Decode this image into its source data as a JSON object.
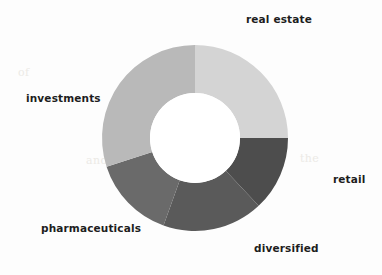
{
  "chart_data": {
    "type": "pie",
    "variant": "donut",
    "title": "",
    "subtitle": "",
    "xlabel": "",
    "ylabel": "",
    "legend_position": "none",
    "labels_position": "outside",
    "grid": false,
    "start_angle_deg": 0,
    "direction": "clockwise",
    "inner_radius_ratio": 0.48,
    "categories": [
      "real estate",
      "retail",
      "diversified",
      "pharmaceuticals",
      "investments"
    ],
    "values": [
      25.0,
      13.0,
      17.5,
      14.5,
      30.0
    ],
    "colors": [
      "#d4d4d4",
      "#4d4d4d",
      "#5a5a5a",
      "#6a6a6a",
      "#b9b9b9"
    ],
    "slices": [
      {
        "label": "real estate",
        "value": 25.0,
        "color": "#d4d4d4",
        "start_deg": 0,
        "end_deg": 90
      },
      {
        "label": "retail",
        "value": 13.0,
        "color": "#4d4d4d",
        "start_deg": 90,
        "end_deg": 136.8
      },
      {
        "label": "diversified",
        "value": 17.5,
        "color": "#5a5a5a",
        "start_deg": 136.8,
        "end_deg": 199.8
      },
      {
        "label": "pharmaceuticals",
        "value": 14.5,
        "color": "#6a6a6a",
        "start_deg": 199.8,
        "end_deg": 252.0
      },
      {
        "label": "investments",
        "value": 30.0,
        "color": "#b9b9b9",
        "start_deg": 252.0,
        "end_deg": 360.0
      }
    ]
  },
  "chart": {
    "center_x": 195,
    "center_y": 138,
    "outer_radius": 93,
    "inner_radius": 45,
    "hole_color": "#ffffff",
    "background": "#fdfdfd"
  },
  "labels": {
    "real_estate": "real estate",
    "retail": "retail",
    "diversified": "diversified",
    "pharmaceuticals": "pharmaceuticals",
    "investments": "investments"
  },
  "artifacts": {
    "ghost_one": "of",
    "ghost_two": "and",
    "ghost_three": "the"
  }
}
